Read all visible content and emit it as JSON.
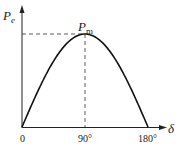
{
  "chart_data": {
    "type": "line",
    "title": "",
    "xlabel": "δ",
    "ylabel": "P_e",
    "x_ticks": [
      "0",
      "90°",
      "180°"
    ],
    "x": [
      0,
      15,
      30,
      45,
      60,
      75,
      90,
      105,
      120,
      135,
      150,
      165,
      180
    ],
    "series": [
      {
        "name": "P_e = P_m sin δ",
        "values": [
          0,
          0.259,
          0.5,
          0.707,
          0.866,
          0.966,
          1.0,
          0.966,
          0.866,
          0.707,
          0.5,
          0.259,
          0
        ]
      }
    ],
    "annotations": [
      {
        "text": "P_m",
        "at": [
          90,
          1.0
        ],
        "note": "dashed guide lines to both axes"
      }
    ],
    "xlim": [
      0,
      180
    ],
    "ylim": [
      0,
      1.15
    ],
    "grid": false,
    "legend": "none"
  },
  "labels": {
    "y_axis_main": "P",
    "y_axis_sub": "e",
    "peak_main": "P",
    "peak_sub": "m",
    "x_axis": "δ",
    "tick_0": "0",
    "tick_90": "90°",
    "tick_180": "180°"
  }
}
